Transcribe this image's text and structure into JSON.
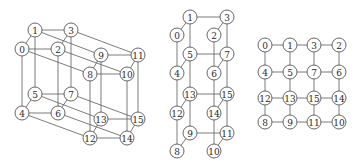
{
  "diagram": {
    "node_style": {
      "radius": 7,
      "stroke": "#555555",
      "fill": "#ffffff",
      "edge_color": "#5a5a5a"
    },
    "graphs": [
      {
        "id": "hypercube-3d",
        "nodes": [
          {
            "label": "0",
            "x": 22,
            "y": 49
          },
          {
            "label": "1",
            "x": 35,
            "y": 30
          },
          {
            "label": "2",
            "x": 58,
            "y": 49
          },
          {
            "label": "3",
            "x": 71,
            "y": 30
          },
          {
            "label": "4",
            "x": 22,
            "y": 113
          },
          {
            "label": "5",
            "x": 35,
            "y": 94
          },
          {
            "label": "6",
            "x": 58,
            "y": 113
          },
          {
            "label": "7",
            "x": 71,
            "y": 94
          },
          {
            "label": "8",
            "x": 90,
            "y": 74
          },
          {
            "label": "9",
            "x": 101,
            "y": 55
          },
          {
            "label": "10",
            "x": 127,
            "y": 74
          },
          {
            "label": "11",
            "x": 138,
            "y": 55
          },
          {
            "label": "12",
            "x": 90,
            "y": 138
          },
          {
            "label": "13",
            "x": 101,
            "y": 119
          },
          {
            "label": "14",
            "x": 127,
            "y": 138
          },
          {
            "label": "15",
            "x": 138,
            "y": 119
          }
        ],
        "edges": [
          [
            "0",
            "1"
          ],
          [
            "1",
            "3"
          ],
          [
            "2",
            "3"
          ],
          [
            "0",
            "2"
          ],
          [
            "4",
            "5"
          ],
          [
            "5",
            "7"
          ],
          [
            "6",
            "7"
          ],
          [
            "4",
            "6"
          ],
          [
            "0",
            "4"
          ],
          [
            "1",
            "5"
          ],
          [
            "2",
            "6"
          ],
          [
            "3",
            "7"
          ],
          [
            "8",
            "9"
          ],
          [
            "9",
            "11"
          ],
          [
            "10",
            "11"
          ],
          [
            "8",
            "10"
          ],
          [
            "12",
            "13"
          ],
          [
            "13",
            "15"
          ],
          [
            "14",
            "15"
          ],
          [
            "12",
            "14"
          ],
          [
            "8",
            "12"
          ],
          [
            "9",
            "13"
          ],
          [
            "10",
            "14"
          ],
          [
            "11",
            "15"
          ],
          [
            "0",
            "8"
          ],
          [
            "1",
            "9"
          ],
          [
            "2",
            "10"
          ],
          [
            "3",
            "11"
          ],
          [
            "4",
            "12"
          ],
          [
            "5",
            "13"
          ],
          [
            "6",
            "14"
          ],
          [
            "7",
            "15"
          ]
        ]
      },
      {
        "id": "unfolded-ladder",
        "nodes": [
          {
            "label": "0",
            "x": 177,
            "y": 35
          },
          {
            "label": "1",
            "x": 190,
            "y": 17
          },
          {
            "label": "2",
            "x": 214,
            "y": 35
          },
          {
            "label": "3",
            "x": 227,
            "y": 17
          },
          {
            "label": "4",
            "x": 177,
            "y": 73
          },
          {
            "label": "5",
            "x": 190,
            "y": 54
          },
          {
            "label": "6",
            "x": 214,
            "y": 73
          },
          {
            "label": "7",
            "x": 227,
            "y": 54
          },
          {
            "label": "12",
            "x": 177,
            "y": 113
          },
          {
            "label": "13",
            "x": 190,
            "y": 94
          },
          {
            "label": "14",
            "x": 214,
            "y": 113
          },
          {
            "label": "15",
            "x": 227,
            "y": 94
          },
          {
            "label": "8",
            "x": 177,
            "y": 151
          },
          {
            "label": "9",
            "x": 190,
            "y": 133
          },
          {
            "label": "10",
            "x": 214,
            "y": 151
          },
          {
            "label": "11",
            "x": 227,
            "y": 133
          }
        ],
        "edges": [
          [
            "0",
            "1"
          ],
          [
            "1",
            "3"
          ],
          [
            "2",
            "3"
          ],
          [
            "4",
            "5"
          ],
          [
            "5",
            "7"
          ],
          [
            "6",
            "7"
          ],
          [
            "12",
            "13"
          ],
          [
            "13",
            "15"
          ],
          [
            "14",
            "15"
          ],
          [
            "8",
            "9"
          ],
          [
            "9",
            "11"
          ],
          [
            "10",
            "11"
          ],
          [
            "0",
            "4"
          ],
          [
            "4",
            "12"
          ],
          [
            "12",
            "8"
          ],
          [
            "1",
            "5"
          ],
          [
            "5",
            "13"
          ],
          [
            "13",
            "9"
          ],
          [
            "2",
            "6"
          ],
          [
            "6",
            "14"
          ],
          [
            "14",
            "10"
          ],
          [
            "3",
            "7"
          ],
          [
            "7",
            "15"
          ],
          [
            "15",
            "11"
          ]
        ]
      },
      {
        "id": "mesh-4x4",
        "nodes": [
          {
            "label": "0",
            "x": 265,
            "y": 45
          },
          {
            "label": "1",
            "x": 290,
            "y": 45
          },
          {
            "label": "3",
            "x": 314,
            "y": 45
          },
          {
            "label": "2",
            "x": 339,
            "y": 45
          },
          {
            "label": "4",
            "x": 265,
            "y": 72
          },
          {
            "label": "5",
            "x": 290,
            "y": 72
          },
          {
            "label": "7",
            "x": 314,
            "y": 72
          },
          {
            "label": "6",
            "x": 339,
            "y": 72
          },
          {
            "label": "12",
            "x": 265,
            "y": 98
          },
          {
            "label": "13",
            "x": 290,
            "y": 98
          },
          {
            "label": "15",
            "x": 314,
            "y": 98
          },
          {
            "label": "14",
            "x": 339,
            "y": 98
          },
          {
            "label": "8",
            "x": 265,
            "y": 122
          },
          {
            "label": "9",
            "x": 290,
            "y": 122
          },
          {
            "label": "11",
            "x": 314,
            "y": 122
          },
          {
            "label": "10",
            "x": 339,
            "y": 122
          }
        ],
        "edges": [
          [
            "0",
            "1"
          ],
          [
            "1",
            "3"
          ],
          [
            "3",
            "2"
          ],
          [
            "4",
            "5"
          ],
          [
            "5",
            "7"
          ],
          [
            "7",
            "6"
          ],
          [
            "12",
            "13"
          ],
          [
            "13",
            "15"
          ],
          [
            "15",
            "14"
          ],
          [
            "8",
            "9"
          ],
          [
            "9",
            "11"
          ],
          [
            "11",
            "10"
          ],
          [
            "0",
            "4"
          ],
          [
            "4",
            "12"
          ],
          [
            "12",
            "8"
          ],
          [
            "1",
            "5"
          ],
          [
            "5",
            "13"
          ],
          [
            "13",
            "9"
          ],
          [
            "3",
            "7"
          ],
          [
            "7",
            "15"
          ],
          [
            "15",
            "11"
          ],
          [
            "2",
            "6"
          ],
          [
            "6",
            "14"
          ],
          [
            "14",
            "10"
          ]
        ]
      }
    ]
  }
}
